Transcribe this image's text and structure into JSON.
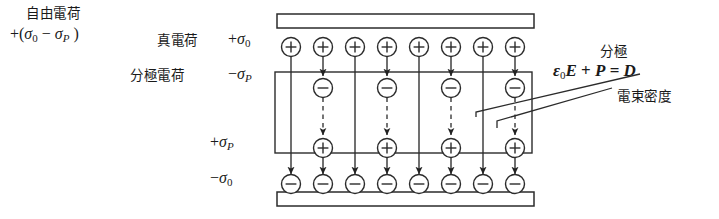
{
  "figure": {
    "type": "physics-diagram",
    "labels": {
      "free_charge_title": "自由電荷",
      "free_charge_value": "+(σ0 − σP )",
      "true_charge_title": "真電荷",
      "true_charge_value": "+σ0",
      "polarization_charge_title": "分極電荷",
      "polarization_charge_value": "−σP",
      "bound_plus_value": "+σP",
      "true_negative_value": "−σ0",
      "polarization_title": "分極",
      "displacement_equation": "ε0E + P = D",
      "flux_density_title": "電束密度"
    },
    "symbols": {
      "plus": "+",
      "minus": "−",
      "sigma": "σ",
      "epsilon": "ε"
    },
    "geometry": {
      "columns": 8,
      "column_x": [
        291,
        323,
        355,
        387,
        419,
        451,
        483,
        515
      ],
      "bound_columns_x": [
        323,
        387,
        451,
        515
      ],
      "top_plate": {
        "x": 277,
        "y": 14,
        "width": 257,
        "height": 14
      },
      "bottom_plate": {
        "x": 277,
        "y": 192,
        "width": 257,
        "height": 14
      },
      "dielectric_box": {
        "x": 275,
        "y": 72,
        "width": 257,
        "height": 81
      },
      "row_y": {
        "true_positive": 47,
        "polarization_negative": 88,
        "polarization_positive": 148,
        "true_negative": 185
      },
      "charge_radius": 9.5
    },
    "rows": [
      {
        "name": "true-positive-row",
        "sign": "+",
        "count": 8,
        "label": "真電荷 +σ0"
      },
      {
        "name": "bound-negative-row",
        "sign": "−",
        "count": 4,
        "label": "分極電荷 −σP"
      },
      {
        "name": "bound-positive-row",
        "sign": "+",
        "count": 4,
        "label": "+σP"
      },
      {
        "name": "true-negative-row",
        "sign": "−",
        "count": 8,
        "label": "−σ0"
      }
    ],
    "colors": {
      "ink": "#1a1a1a",
      "stroke": "#333333",
      "background": "#ffffff",
      "plate_fill": "#ffffff"
    }
  }
}
